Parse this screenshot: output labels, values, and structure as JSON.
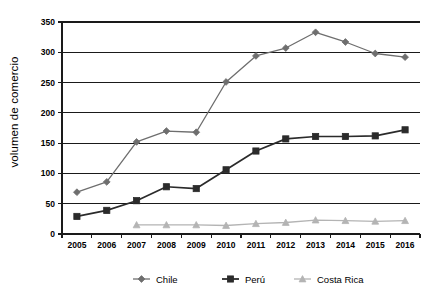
{
  "chart_data": {
    "type": "line",
    "title": "",
    "xlabel": "",
    "ylabel": "volumen de comercio",
    "categories": [
      "2005",
      "2006",
      "2007",
      "2008",
      "2009",
      "2010",
      "2011",
      "2012",
      "2013",
      "2014",
      "2015",
      "2016"
    ],
    "ylim": [
      0,
      350
    ],
    "yticks": [
      0,
      50,
      100,
      150,
      200,
      250,
      300,
      350
    ],
    "grid": "horizontal",
    "legend_position": "bottom",
    "series": [
      {
        "name": "Chile",
        "marker": "diamond",
        "color": "#6e6e6e",
        "values": [
          69,
          86,
          152,
          170,
          168,
          251,
          294,
          307,
          333,
          317,
          298,
          292
        ]
      },
      {
        "name": "Perú",
        "marker": "square",
        "color": "#2b2b2b",
        "values": [
          29,
          39,
          55,
          78,
          75,
          106,
          137,
          157,
          161,
          161,
          162,
          172
        ]
      },
      {
        "name": "Costa Rica",
        "marker": "triangle",
        "color": "#b4b4b4",
        "values": [
          null,
          null,
          15,
          15,
          15,
          14,
          17,
          19,
          23,
          22,
          21,
          22
        ]
      }
    ]
  },
  "axes": {
    "ytick_labels": [
      "350",
      "300",
      "250",
      "200",
      "150",
      "100",
      "50",
      "0"
    ],
    "xtick_labels": [
      "2005",
      "2006",
      "2007",
      "2008",
      "2009",
      "2010",
      "2011",
      "2012",
      "2013",
      "2014",
      "2015",
      "2016"
    ],
    "y_axis_title": "volumen de comercio"
  },
  "legend": {
    "items": [
      {
        "label": "Chile",
        "color": "#6e6e6e",
        "marker": "diamond"
      },
      {
        "label": "Perú",
        "color": "#2b2b2b",
        "marker": "square"
      },
      {
        "label": "Costa Rica",
        "color": "#b4b4b4",
        "marker": "triangle"
      }
    ]
  }
}
